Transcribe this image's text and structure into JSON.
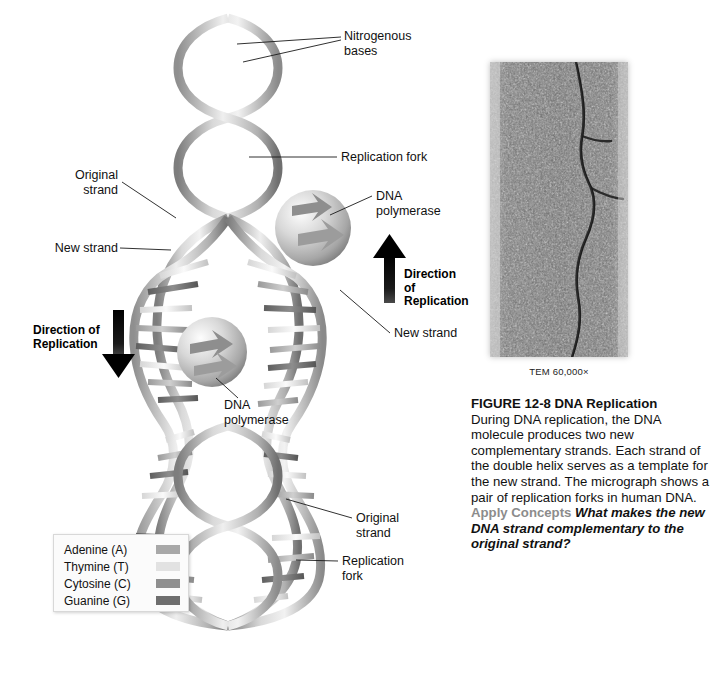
{
  "figure": {
    "number": "FIGURE 12-8",
    "title": "DNA Replication",
    "body": "During DNA replication, the DNA molecule produces two new complementary strands. Each strand of the double helix serves as a template for the new strand. The micrograph shows a pair of replication forks in human DNA.",
    "apply_concepts_label": "Apply Concepts",
    "question": "What makes the new DNA strand complementary to the original strand?"
  },
  "micrograph": {
    "magnification_label": "TEM 60,000×",
    "alt": "Transmission electron micrograph of a pair of replication forks in human DNA"
  },
  "diagram": {
    "callouts": {
      "nitrogenous_bases": "Nitrogenous\nbases",
      "replication_fork_top": "Replication fork",
      "original_strand_left": "Original\nstrand",
      "new_strand_left": "New strand",
      "dna_polymerase_right": "DNA polymerase",
      "new_strand_right": "New strand",
      "dna_polymerase_center": "DNA\npolymerase",
      "original_strand_bottom": "Original\nstrand",
      "replication_fork_bottom": "Replication\nfork"
    },
    "direction_labels": {
      "left": "Direction of\nReplication",
      "right": "Direction of\nReplication"
    }
  },
  "legend": {
    "items": [
      {
        "label": "Adenine (A)",
        "color": "#a8a8a8"
      },
      {
        "label": "Thymine (T)",
        "color": "#e2e2e2"
      },
      {
        "label": "Cytosine (C)",
        "color": "#8f8f8f"
      },
      {
        "label": "Guanine (G)",
        "color": "#6e6e6e"
      }
    ]
  },
  "colors": {
    "backbone_light": "#e8e8e8",
    "backbone_mid": "#b4b4b4",
    "backbone_dark": "#6a6a6a",
    "enzyme": "#c9c9c9",
    "arrow": "#000000",
    "page_background": "#ffffff"
  }
}
